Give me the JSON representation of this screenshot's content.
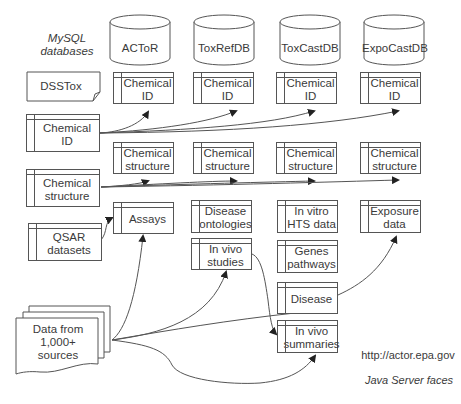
{
  "header": {
    "mysql_label_line1": "MySQL",
    "mysql_label_line2": "databases"
  },
  "databases": [
    {
      "name": "ACToR"
    },
    {
      "name": "ToxRefDB"
    },
    {
      "name": "ToxCastDB"
    },
    {
      "name": "ExpoCastDB"
    }
  ],
  "sources": {
    "dsstox": "DSSTox",
    "chemical_id_line1": "Chemical",
    "chemical_id_line2": "ID",
    "chemical_structure_line1": "Chemical",
    "chemical_structure_line2": "structure",
    "qsar_line1": "QSAR",
    "qsar_line2": "datasets",
    "data_line1": "Data from",
    "data_line2": "1,000+",
    "data_line3": "sources"
  },
  "tables": {
    "chem_id_line1": "Chemical",
    "chem_id_line2": "ID",
    "chem_struct_line1": "Chemical",
    "chem_struct_line2": "structure",
    "assays": "Assays",
    "disease_ontologies_line1": "Disease",
    "disease_ontologies_line2": "ontologies",
    "in_vivo_studies_line1": "In vivo",
    "in_vivo_studies_line2": "studies",
    "in_vitro_line1": "In vitro",
    "in_vitro_line2": "HTS data",
    "genes_line1": "Genes",
    "genes_line2": "pathways",
    "disease": "Disease",
    "in_vivo_summaries_line1": "In vivo",
    "in_vivo_summaries_line2": "summaries",
    "exposure_line1": "Exposure",
    "exposure_line2": "data"
  },
  "footer": {
    "url": "http://actor.epa.gov",
    "tech": "Java Server faces"
  },
  "colors": {
    "stroke": "#555555",
    "text": "#3a3a3a",
    "background": "#ffffff"
  }
}
